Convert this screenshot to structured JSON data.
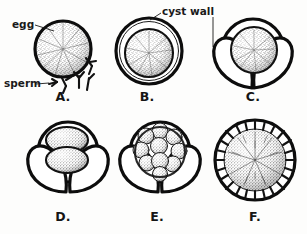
{
  "figure": {
    "background_color": "#fdfdfc",
    "ink_color": "#0d0d0d",
    "stipple_color": "#2b2b2b"
  },
  "callouts": [
    {
      "id": "egg",
      "text": "egg",
      "x": 12,
      "y": 28,
      "points_to": "panel-a-egg-sphere"
    },
    {
      "id": "sperm",
      "text": "sperm",
      "x": 4,
      "y": 84,
      "points_to": "panel-a-sperm-cluster"
    },
    {
      "id": "cyst-wall",
      "text": "cyst wall",
      "x": 162,
      "y": 15,
      "points_to": "panel-b-cyst-wall"
    }
  ],
  "panels": [
    {
      "id": "a",
      "letter": "A.",
      "label_x": 63,
      "label_y": 101,
      "caption": "Egg with sperm approaching",
      "stage": "fertilization",
      "center_x": 63,
      "center_y": 49,
      "radius": 28,
      "has_cyst_wall": false,
      "has_valves": false,
      "cell_count": 1,
      "has_cilia": false
    },
    {
      "id": "b",
      "letter": "B.",
      "label_x": 147,
      "label_y": 101,
      "caption": "Zygote enclosed by cyst wall",
      "stage": "encystment",
      "center_x": 149,
      "center_y": 51,
      "radius": 25,
      "has_cyst_wall": true,
      "has_valves": false,
      "cell_count": 1,
      "has_cilia": false
    },
    {
      "id": "c",
      "letter": "C.",
      "label_x": 251,
      "label_y": 101,
      "caption": "Cyst with valves opening",
      "stage": "valve formation",
      "center_x": 251,
      "center_y": 52,
      "radius": 25,
      "has_cyst_wall": true,
      "has_valves": true,
      "cell_count": 1,
      "has_cilia": false
    },
    {
      "id": "d",
      "letter": "D.",
      "label_x": 63,
      "label_y": 219,
      "caption": "Two-cell cleavage stage",
      "stage": "2-cell",
      "center_x": 68,
      "center_y": 155,
      "radius": 25,
      "has_cyst_wall": true,
      "has_valves": true,
      "cell_count": 2,
      "has_cilia": false
    },
    {
      "id": "e",
      "letter": "E.",
      "label_x": 155,
      "label_y": 219,
      "caption": "Morula — multicellular cluster",
      "stage": "morula",
      "center_x": 160,
      "center_y": 155,
      "radius": 25,
      "has_cyst_wall": true,
      "has_valves": true,
      "cell_count": 10,
      "has_cilia": false
    },
    {
      "id": "f",
      "letter": "F.",
      "label_x": 255,
      "label_y": 219,
      "caption": "Ciliated larva within membrane",
      "stage": "ciliated larva",
      "center_x": 255,
      "center_y": 160,
      "radius": 40,
      "has_cyst_wall": true,
      "has_valves": false,
      "cell_count": 1,
      "has_cilia": true
    }
  ]
}
